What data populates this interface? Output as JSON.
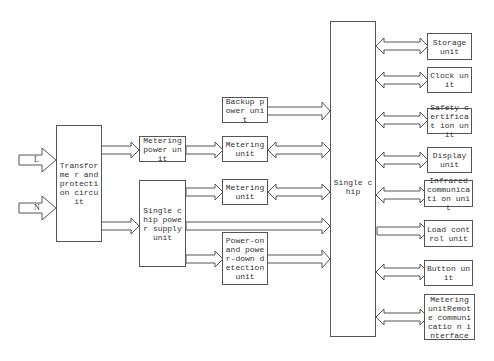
{
  "diagram": {
    "inputs": {
      "L": "L",
      "N": "N"
    },
    "boxes": {
      "transformer": "Transforme r and protection circuit",
      "metering_power": "Metering power unit",
      "single_chip_power": "Single chip power supply unit",
      "backup_power": "Backup power unit",
      "metering_unit_1": "Metering unit",
      "metering_unit_2": "Metering unit",
      "power_detection": "Power-on and power-down detection unit",
      "single_chip": "Single chip",
      "storage": "Storage unit",
      "clock": "Clock unit",
      "safety": "Safety certificat ion unit",
      "display": "Display unit",
      "infrared": "Infrared communicati on unit",
      "load_control": "Load control unit",
      "button": "Button unit",
      "remote_comm": "Metering unitRemote communicatio n interface"
    },
    "colors": {
      "line": "#555555",
      "background": "#ffffff"
    }
  }
}
